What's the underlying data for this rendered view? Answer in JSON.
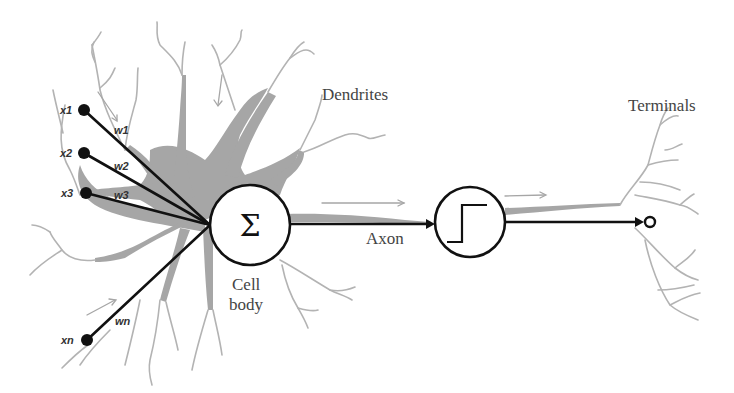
{
  "diagram": {
    "labels": {
      "dendrites": "Dendrites",
      "terminals": "Terminals",
      "axon": "Axon",
      "cell_body_line1": "Cell",
      "cell_body_line2": "body",
      "summation_symbol": "Σ"
    },
    "inputs": [
      {
        "x_label": "x1",
        "w_label": "w1"
      },
      {
        "x_label": "x2",
        "w_label": "w2"
      },
      {
        "x_label": "x3",
        "w_label": "w3"
      },
      {
        "x_label": "xn",
        "w_label": "wn"
      }
    ],
    "nodes": {
      "summation": "summation-node",
      "activation": "step-activation-node",
      "output": "output-terminal"
    },
    "colors": {
      "neuron_fill": "#a6a6a6",
      "dendrite_line": "#b3b3b3",
      "connection_line": "#111111",
      "label_text": "#444444"
    }
  }
}
